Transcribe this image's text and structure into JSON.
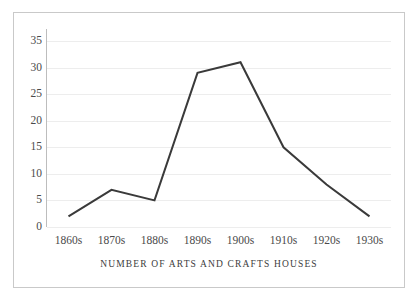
{
  "chart_data": {
    "type": "line",
    "title": "NUMBER OF ARTS AND CRAFTS HOUSES",
    "title_position": "below-x-axis",
    "xlabel": "",
    "ylabel": "",
    "categories": [
      "1860s",
      "1870s",
      "1880s",
      "1890s",
      "1900s",
      "1910s",
      "1920s",
      "1930s"
    ],
    "values": [
      2,
      7,
      5,
      29,
      31,
      15,
      8,
      2
    ],
    "series": [
      {
        "name": "Arts and Crafts houses",
        "values": [
          2,
          7,
          5,
          29,
          31,
          15,
          8,
          2
        ],
        "color": "#3a3a3a"
      }
    ],
    "ylim": [
      0,
      35
    ],
    "yticks": [
      0,
      5,
      10,
      15,
      20,
      25,
      30,
      35
    ],
    "ytick_labels": [
      "0",
      "5",
      "10",
      "15",
      "20",
      "25",
      "30",
      "35"
    ],
    "grid": true,
    "grid_axis": "y",
    "legend": false,
    "markers": false,
    "line_width": 2
  },
  "style": {
    "line_color": "#3a3a3a",
    "grid_color": "#ededed",
    "axis_color": "#bdbdbd",
    "border_color": "#c9c9c9",
    "text_color": "#4a4a4a",
    "title_color": "#3c3c3c",
    "background": "#ffffff"
  }
}
